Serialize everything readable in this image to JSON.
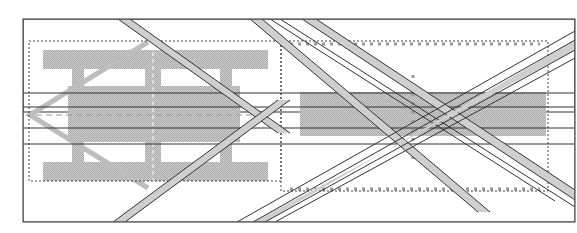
{
  "diagram": {
    "title": "",
    "colors": {
      "background": "#ffffff",
      "frame": "#555555",
      "line": "#333333",
      "fill": "#bdbdbd",
      "dotted": "#444444",
      "marker": "#9a9a9a"
    },
    "regions": [
      {
        "name": "left-panel",
        "content": "hatched H-shaped figure with central block and chevron outline"
      },
      {
        "name": "right-panel",
        "content": "hatched horizontal bar with dotted vertical marker column"
      }
    ],
    "annotations": []
  }
}
